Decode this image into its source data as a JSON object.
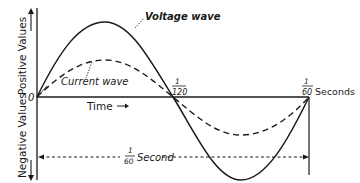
{
  "diagram": {
    "y_axis": {
      "positive_label": "Positive Values",
      "negative_label": "Negative Values",
      "origin_label": "0"
    },
    "x_axis": {
      "label": "Time",
      "tick_half": {
        "num": "1",
        "den": "120"
      },
      "tick_full": {
        "num": "1",
        "den": "60"
      },
      "tick_full_unit": "Seconds"
    },
    "curves": [
      {
        "name": "Voltage wave",
        "style": "solid",
        "amplitude_rel": 1.0
      },
      {
        "name": "Current wave",
        "style": "dashed",
        "amplitude_rel": 0.5
      }
    ],
    "period_annotation": {
      "num": "1",
      "den": "60",
      "unit": "Second"
    },
    "colors": {
      "ink": "#1a1a1a",
      "background": "#ffffff"
    }
  }
}
